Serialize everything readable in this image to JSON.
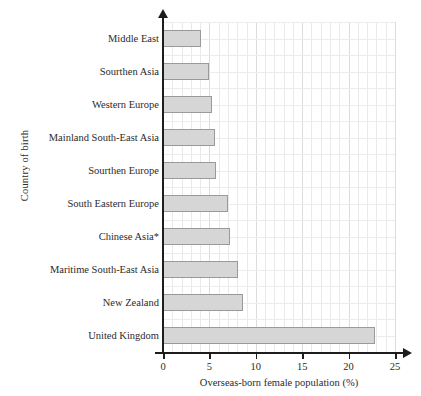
{
  "chart_data": {
    "type": "bar",
    "orientation": "horizontal",
    "title": "",
    "xlabel": "Overseas-born female population (%)",
    "ylabel": "Country of birth",
    "xlim": [
      0,
      25
    ],
    "xticks": [
      0,
      5,
      10,
      15,
      20,
      25
    ],
    "grid": true,
    "legend": null,
    "categories": [
      "Middle East",
      "Sourthen Asia",
      "Western Europe",
      "Mainland South-East Asia",
      "Sourthen Europe",
      "South Eastern Europe",
      "Chinese Asia*",
      "Maritime South-East Asia",
      "New Zealand",
      "United Kingdom"
    ],
    "values": [
      4.1,
      5.0,
      5.3,
      5.6,
      5.7,
      7.0,
      7.2,
      8.1,
      8.6,
      22.8
    ],
    "bar_fill_color": "#d6d6d6",
    "bar_border_color": "#9a9a9a",
    "axis_color": "#1d1d1d",
    "grid_color": "#e9e9e9"
  }
}
